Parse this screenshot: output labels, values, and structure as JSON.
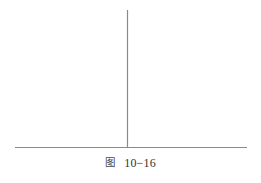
{
  "figure": {
    "caption_label": "图",
    "caption_number": "10−16",
    "caption_full": "图 10−16"
  },
  "chart_data": {
    "type": "line",
    "xlabel": "",
    "ylabel": "",
    "grid": false,
    "legend": null,
    "annotations": [],
    "axes": {
      "horizontal_axis": {
        "name": "baseline",
        "x_start": 15,
        "x_end": 247,
        "y": 147,
        "color": "#8a8a8a",
        "width": 1.2
      },
      "vertical_axis": {
        "name": "impulse-line",
        "x": 127,
        "y_top": 10,
        "y_bottom": 147,
        "color": "#8a8a8a",
        "width": 1.2
      }
    },
    "series": [
      {
        "name": "impulse",
        "x": [
          127
        ],
        "values": [
          137
        ]
      }
    ],
    "xlim": [
      15,
      247
    ],
    "ylim": [
      0,
      137
    ]
  },
  "colors": {
    "background": "#ffffff",
    "line": "#8a8a8a",
    "text": "#3a3a3a"
  }
}
